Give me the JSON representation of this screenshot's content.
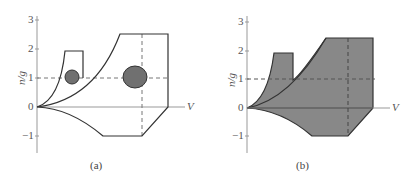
{
  "figure": {
    "panels": [
      {
        "id": "a",
        "caption": "(a)",
        "ylabel": "n/g",
        "xlabel": "V",
        "yticks": [
          "3",
          "2",
          "1",
          "0",
          "−1"
        ],
        "style": "outline-with-ellipses"
      },
      {
        "id": "b",
        "caption": "(b)",
        "ylabel": "n/g",
        "xlabel": "V",
        "yticks": [
          "3",
          "2",
          "1",
          "0",
          "−1"
        ],
        "style": "filled"
      }
    ],
    "colors": {
      "line": "#333333",
      "fill": "#808080",
      "axis": "#888888"
    }
  }
}
